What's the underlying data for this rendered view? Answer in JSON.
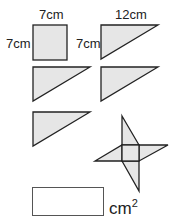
{
  "labels": {
    "square_top": "7cm",
    "square_side": "7cm",
    "triangle_top": "12cm",
    "triangle_side": "7cm"
  },
  "answer": {
    "value": "",
    "unit": "cm",
    "unit_power": "2"
  },
  "colors": {
    "fill": "#e6e6e6",
    "stroke": "#222222"
  }
}
